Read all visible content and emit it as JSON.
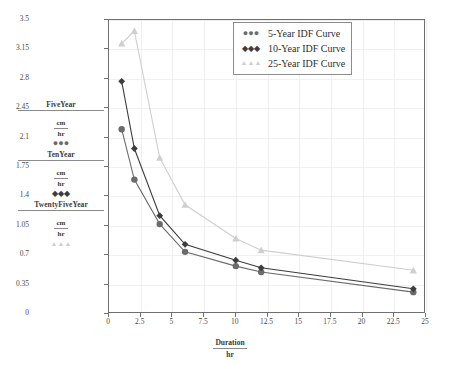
{
  "chart_data": {
    "type": "line",
    "title": "",
    "xlabel": "Duration",
    "xlabel_unit": "hr",
    "ylabel": "",
    "ylabel_unit": "cm/hr",
    "xlim": [
      0,
      25
    ],
    "ylim": [
      0,
      3.5
    ],
    "xticks": [
      "0",
      "2.5",
      "5",
      "7.5",
      "10",
      "12.5",
      "15",
      "17.5",
      "20",
      "22.5",
      "25"
    ],
    "yticks": [
      "0",
      "0.35",
      "0.7",
      "1.05",
      "1.4",
      "1.75",
      "2.1",
      "2.45",
      "2.8",
      "3.15",
      "3.5"
    ],
    "grid": true,
    "legend_position": "upper-right",
    "x": [
      1,
      2,
      4,
      6,
      10,
      12,
      24
    ],
    "series": [
      {
        "name": "5-Year IDF Curve",
        "legend_label": "5-Year IDF Curve",
        "marker": "circle",
        "color": "#6b6b6b",
        "values": [
          2.2,
          1.6,
          1.07,
          0.74,
          0.57,
          0.5,
          0.26
        ]
      },
      {
        "name": "10-Year IDF Curve",
        "legend_label": "10-Year IDF Curve",
        "marker": "diamond",
        "color": "#3d3d3d",
        "values": [
          2.77,
          1.97,
          1.17,
          0.83,
          0.64,
          0.55,
          0.3
        ]
      },
      {
        "name": "25-Year IDF Curve",
        "legend_label": "25-Year IDF Curve",
        "marker": "triangle",
        "color": "#cfcfcf",
        "values": [
          3.22,
          3.37,
          1.86,
          1.3,
          0.9,
          0.76,
          0.52
        ]
      }
    ]
  },
  "left_legend": {
    "items": [
      {
        "title": "FiveYear",
        "unit_numerator": "cm",
        "unit_denominator": "hr",
        "marker_glyph": "●●●",
        "marker_color": "#6b6b6b"
      },
      {
        "title": "TenYear",
        "unit_numerator": "cm",
        "unit_denominator": "hr",
        "marker_glyph": "◆◆◆",
        "marker_color": "#3d3d3d"
      },
      {
        "title": "TwentyFiveYear",
        "unit_numerator": "cm",
        "unit_denominator": "hr",
        "marker_glyph": "▲▲▲",
        "marker_color": "#cfcfcf"
      }
    ]
  },
  "legend_box": {
    "rows": [
      {
        "symbol": "●●●",
        "label": "5-Year IDF Curve",
        "color": "#6b6b6b"
      },
      {
        "symbol": "◆◆◆",
        "label": "10-Year IDF Curve",
        "color": "#3d3d3d"
      },
      {
        "symbol": "▲▲▲",
        "label": "25-Year IDF Curve",
        "color": "#cfcfcf"
      }
    ]
  },
  "colors": {
    "axis": "#6f6f6f",
    "grid": "#f0f0f0",
    "background": "#ffffff",
    "five_year": "#6b6b6b",
    "ten_year": "#3d3d3d",
    "twenty_five_year": "#cfcfcf"
  }
}
